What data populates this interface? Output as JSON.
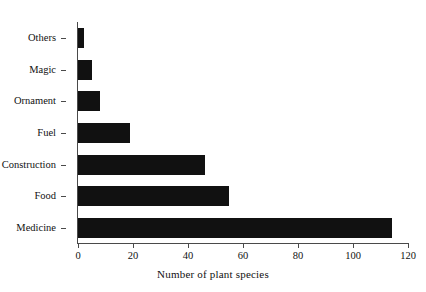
{
  "chart_data": {
    "type": "bar",
    "orientation": "horizontal",
    "title": "",
    "subtitle": "",
    "xlabel": "Number of plant species",
    "ylabel": "",
    "categories": [
      "Medicine",
      "Food",
      "Construction",
      "Fuel",
      "Ornament",
      "Magic",
      "Others"
    ],
    "values": [
      114,
      55,
      46,
      19,
      8,
      5,
      2
    ],
    "series": [
      {
        "name": "Number of plant species",
        "values": [
          114,
          55,
          46,
          19,
          8,
          5,
          2
        ]
      }
    ],
    "xlim": [
      0,
      120
    ],
    "xticks": [
      0,
      20,
      40,
      60,
      80,
      100,
      120
    ],
    "xtick_labels": [
      "0",
      "20",
      "40",
      "60",
      "80",
      "100",
      "120"
    ],
    "ytick_labels": [
      "Others",
      "Magic",
      "Ornament",
      "Fuel",
      "Construction",
      "Food",
      "Medicine"
    ],
    "grid": false,
    "legend": false,
    "legend_position": "none",
    "bar_color": "#111111",
    "axis_color": "#4a4a4a",
    "background_color": "#ffffff"
  },
  "axis": {
    "x_title": "Number of plant species",
    "ticks": [
      {
        "label": "0",
        "value": 0
      },
      {
        "label": "20",
        "value": 20
      },
      {
        "label": "40",
        "value": 40
      },
      {
        "label": "60",
        "value": 60
      },
      {
        "label": "80",
        "value": 80
      },
      {
        "label": "100",
        "value": 100
      },
      {
        "label": "120",
        "value": 120
      }
    ]
  },
  "bars": [
    {
      "label": "Others",
      "value": 2
    },
    {
      "label": "Magic",
      "value": 5
    },
    {
      "label": "Ornament",
      "value": 8
    },
    {
      "label": "Fuel",
      "value": 19
    },
    {
      "label": "Construction",
      "value": 46
    },
    {
      "label": "Food",
      "value": 55
    },
    {
      "label": "Medicine",
      "value": 114
    }
  ]
}
